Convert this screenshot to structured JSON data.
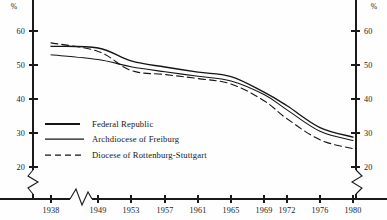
{
  "chart_data": {
    "type": "line",
    "title": "",
    "subtitle": "",
    "xlabel": "",
    "ylabel": "",
    "unit_label_left": "%",
    "unit_label_right": "%",
    "x": [
      1938,
      1949,
      1953,
      1957,
      1961,
      1965,
      1969,
      1972,
      1976,
      1980
    ],
    "xtick_labels": [
      "1938",
      "1949",
      "1953",
      "1957",
      "1961",
      "1965",
      "1969",
      "1972",
      "1976",
      "1980"
    ],
    "ytick_labels": [
      "60",
      "50",
      "40",
      "30",
      "20"
    ],
    "yticks": [
      60,
      50,
      40,
      30,
      20
    ],
    "ylim": [
      20,
      65
    ],
    "grid": false,
    "x_axis_break": true,
    "x_axis_break_between": [
      1938,
      1949
    ],
    "y_axis_break": true,
    "y_axis_break_below": 20,
    "legend_position": "inside-lower-left",
    "series": [
      {
        "name": "Federal Republic",
        "style": "solid",
        "values": [
          55.5,
          55.0,
          51.2,
          49.4,
          47.9,
          46.6,
          42.0,
          38.0,
          31.6,
          28.8
        ]
      },
      {
        "name": "Archdiocese of Freiburg",
        "style": "solid",
        "values": [
          53.0,
          51.6,
          49.5,
          48.0,
          46.7,
          45.3,
          41.3,
          36.8,
          30.5,
          27.8
        ]
      },
      {
        "name": "Diocese of Rottenburg-Stuttgart",
        "style": "dashed",
        "values": [
          56.5,
          54.0,
          48.4,
          47.2,
          46.0,
          44.4,
          39.5,
          34.2,
          28.0,
          25.4
        ]
      }
    ]
  },
  "legend": {
    "items": [
      {
        "label": "Federal Republic",
        "style": "solid-thick"
      },
      {
        "label": "Archdiocese of Freiburg",
        "style": "solid"
      },
      {
        "label": "Diocese of Rottenburg-Stuttgart",
        "style": "dashed"
      }
    ]
  },
  "axes": {
    "left_unit": "%",
    "right_unit": "%"
  }
}
